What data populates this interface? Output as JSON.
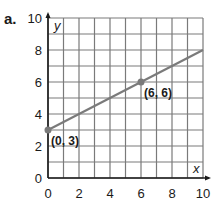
{
  "problem_label": "a.",
  "colors": {
    "grid": "#7a7a7a",
    "axis": "#1a1a1a",
    "line": "#7a7a7a",
    "point": "#7a7a7a",
    "text": "#1a1a1a"
  },
  "chart_data": {
    "type": "line",
    "title": "",
    "xlabel": "x",
    "ylabel": "y",
    "xlim": [
      0,
      10
    ],
    "ylim": [
      0,
      10
    ],
    "grid": true,
    "grid_step": 1,
    "x_ticks": [
      "0",
      "2",
      "4",
      "6",
      "8",
      "10"
    ],
    "y_ticks": [
      "0",
      "2",
      "4",
      "6",
      "8",
      "10"
    ],
    "series": [
      {
        "name": "line",
        "x": [
          0,
          10
        ],
        "y": [
          3,
          8
        ]
      }
    ],
    "points": [
      {
        "x": 0,
        "y": 3,
        "label": "(0, 3)"
      },
      {
        "x": 6,
        "y": 6,
        "label": "(6, 6)"
      }
    ]
  }
}
